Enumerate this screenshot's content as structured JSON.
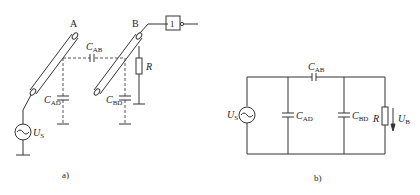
{
  "figure_a": {
    "caption": "a)",
    "node_a_label": "A",
    "node_b_label": "B",
    "cap_ab": {
      "main": "C",
      "sub": "AB"
    },
    "cap_ad": {
      "main": "C",
      "sub": "AD"
    },
    "cap_bd": {
      "main": "C",
      "sub": "BD"
    },
    "resistor_label": "R",
    "source_label": {
      "main": "U",
      "sub": "S"
    },
    "gate_label": "1"
  },
  "figure_b": {
    "caption": "b)",
    "cap_ab": {
      "main": "C",
      "sub": "AB"
    },
    "cap_ad": {
      "main": "C",
      "sub": "AD"
    },
    "cap_bd": {
      "main": "C",
      "sub": "BD"
    },
    "resistor_label": "R",
    "source_label": {
      "main": "U",
      "sub": "S"
    },
    "output_label": {
      "main": "U",
      "sub": "B"
    }
  },
  "colors": {
    "line": "#333333",
    "dashed": "#555555"
  }
}
